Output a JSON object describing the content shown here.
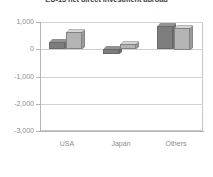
{
  "chart_data": {
    "type": "bar",
    "title": "EU-15 net direct investment abroad",
    "subtitle": "",
    "xlabel": "",
    "ylabel": "",
    "categories": [
      "USA",
      "Japan",
      "Others"
    ],
    "series": [
      {
        "name": "series-1",
        "color": "#7d7d7d",
        "values": [
          250,
          -200,
          850
        ]
      },
      {
        "name": "series-2",
        "color": "#b4b4b4",
        "values": [
          620,
          180,
          790
        ]
      }
    ],
    "ylim": [
      -3000,
      1000
    ],
    "yticks": [
      1000,
      0,
      -1000,
      -2000,
      -3000
    ],
    "ytick_labels": [
      "1,000",
      "0",
      "-1,000",
      "-2,000",
      "-3,000"
    ],
    "grid": true,
    "legend": "none",
    "style": "3d-bars"
  },
  "axis": {
    "y_labels": [
      "1,000",
      "0",
      "-1,000",
      "-2,000",
      "-3,000"
    ],
    "x_labels": [
      "USA",
      "Japan",
      "Others"
    ]
  },
  "colors": {
    "series_1": "#7d7d7d",
    "series_2": "#b4b4b4",
    "grid": "#d2d2d2",
    "axis": "#b5b5b5",
    "tick_text": "#8c8c8c",
    "title_text": "#3d3d3d",
    "background": "#ffffff"
  }
}
